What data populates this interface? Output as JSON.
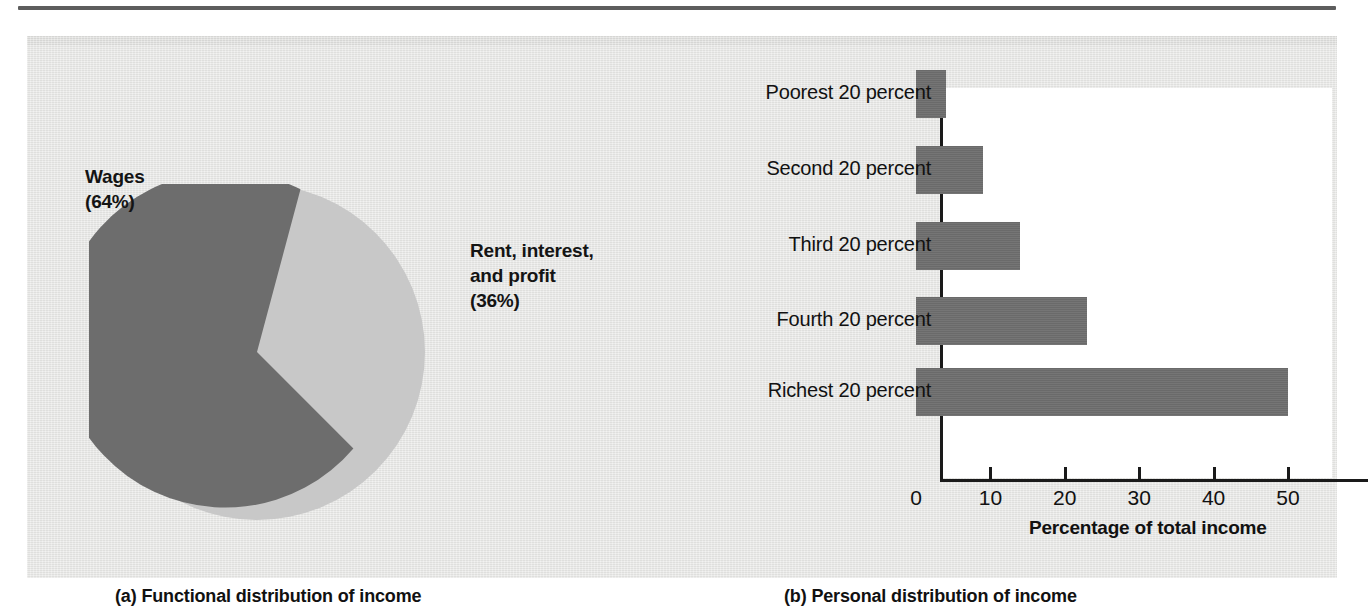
{
  "figure": {
    "background_color": "#e8e8e6",
    "ink_color": "#111111",
    "dark_series_color": "#6d6d6d",
    "light_series_color": "#c8c8c8",
    "plot_background_color": "#ffffff"
  },
  "panel_a": {
    "caption": "(a) Functional distribution of income",
    "labels": {
      "wages": "Wages\n(64%)",
      "rent": "Rent, interest,\nand profit\n(36%)"
    }
  },
  "panel_b": {
    "caption": "(b) Personal distribution of income",
    "axis_title": "Percentage of total income",
    "tick_labels": [
      "0",
      "10",
      "20",
      "30",
      "40",
      "50"
    ],
    "categories": [
      "Poorest 20 percent",
      "Second 20 percent",
      "Third 20 percent",
      "Fourth 20 percent",
      "Richest 20 percent"
    ]
  },
  "chart_data": [
    {
      "type": "pie",
      "title": "(a) Functional distribution of income",
      "labels": [
        "Wages",
        "Rent, interest, and profit"
      ],
      "values": [
        64,
        36
      ],
      "value_unit": "percent",
      "slice_labels": [
        "Wages\n(64%)",
        "Rent, interest,\nand profit\n(36%)"
      ],
      "colors": [
        "#6d6d6d",
        "#c8c8c8"
      ],
      "start_angle_deg": 15,
      "legend": "none"
    },
    {
      "type": "bar",
      "orientation": "horizontal",
      "title": "(b) Personal distribution of income",
      "categories": [
        "Poorest 20 percent",
        "Second 20 percent",
        "Third 20 percent",
        "Fourth 20 percent",
        "Richest 20 percent"
      ],
      "values": [
        4,
        9,
        14,
        23,
        50
      ],
      "xlabel": "Percentage of total income",
      "ylabel": "",
      "xlim": [
        0,
        57
      ],
      "xticks": [
        0,
        10,
        20,
        30,
        40,
        50
      ],
      "grid": false,
      "legend": "none",
      "bar_color": "#6d6d6d"
    }
  ]
}
